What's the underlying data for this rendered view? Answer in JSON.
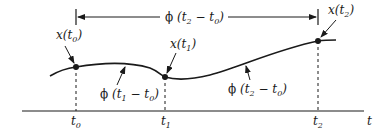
{
  "diagram": {
    "type": "state-transition-trajectory",
    "colors": {
      "stroke": "#1a1a1a",
      "background": "#ffffff"
    },
    "top_span": {
      "phi": "ϕ",
      "args": "(t",
      "sub_a": "2",
      "mid": " − t",
      "sub_b": "0",
      "close": ")"
    },
    "points": [
      {
        "name": "x(t",
        "sub": "0",
        "close": ")"
      },
      {
        "name": "x(t",
        "sub": "1",
        "close": ")"
      },
      {
        "name": "x(t",
        "sub": "2",
        "close": ")"
      }
    ],
    "curve_labels": [
      {
        "phi": "ϕ",
        "args": "(t",
        "sub_a": "1",
        "mid": " − t",
        "sub_b": "0",
        "close": ")"
      },
      {
        "phi": "ϕ",
        "args": "(t",
        "sub_a": "2",
        "mid": " − t",
        "sub_b": "0",
        "close": ")"
      }
    ],
    "axis": {
      "label": "t",
      "ticks": [
        {
          "name": "t",
          "sub": "0"
        },
        {
          "name": "t",
          "sub": "1"
        },
        {
          "name": "t",
          "sub": "2"
        }
      ]
    }
  }
}
